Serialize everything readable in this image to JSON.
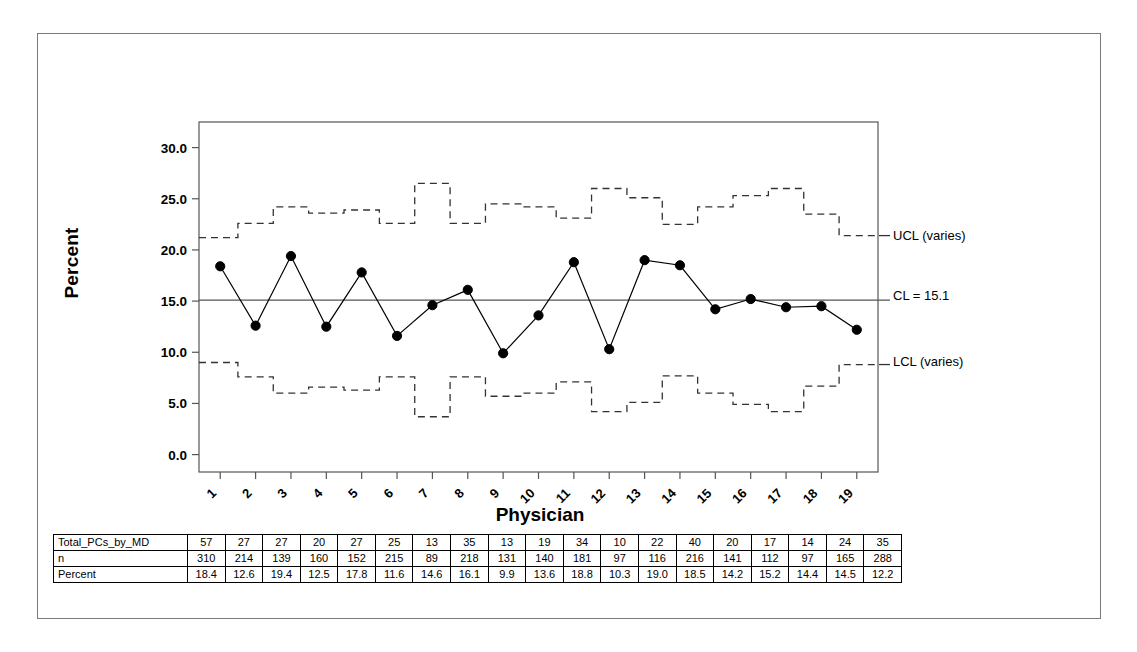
{
  "chart_data": {
    "type": "line",
    "title": "",
    "xlabel": "Physician",
    "ylabel": "Percent",
    "x": [
      1,
      2,
      3,
      4,
      5,
      6,
      7,
      8,
      9,
      10,
      11,
      12,
      13,
      14,
      15,
      16,
      17,
      18,
      19
    ],
    "xticklabels": [
      "1",
      "2",
      "3",
      "4",
      "5",
      "6",
      "7",
      "8",
      "9",
      "10",
      "11",
      "12",
      "13",
      "14",
      "15",
      "16",
      "17",
      "18",
      "19"
    ],
    "yticklabels": [
      "0.0",
      "5.0",
      "10.0",
      "15.0",
      "20.0",
      "25.0",
      "30.0"
    ],
    "ytickvalues": [
      0.0,
      5.0,
      10.0,
      15.0,
      20.0,
      25.0,
      30.0
    ],
    "ylim": [
      -1.7,
      32.5
    ],
    "xlim": [
      0.4,
      19.6
    ],
    "grid": false,
    "legend_position": "right-annotations",
    "series": [
      {
        "name": "Percent",
        "marker": "filled-circle",
        "values": [
          18.4,
          12.6,
          19.4,
          12.5,
          17.8,
          11.6,
          14.6,
          16.1,
          9.9,
          13.6,
          18.8,
          10.3,
          19.0,
          18.5,
          14.2,
          15.2,
          14.4,
          14.5,
          12.2
        ]
      },
      {
        "name": "UCL (varies)",
        "style": "dashed-step",
        "values": [
          21.2,
          22.6,
          24.2,
          23.6,
          23.9,
          22.6,
          26.5,
          22.6,
          24.5,
          24.2,
          23.1,
          26.0,
          25.1,
          22.5,
          24.2,
          25.3,
          26.0,
          23.5,
          21.4
        ]
      },
      {
        "name": "LCL (varies)",
        "style": "dashed-step",
        "values": [
          9.0,
          7.6,
          6.0,
          6.6,
          6.3,
          7.6,
          3.7,
          7.6,
          5.7,
          6.0,
          7.1,
          4.2,
          5.1,
          7.7,
          6.0,
          4.9,
          4.2,
          6.7,
          8.8
        ]
      },
      {
        "name": "CL = 15.1",
        "style": "solid",
        "value": 15.1
      }
    ],
    "annotations": [
      {
        "id": "ucl",
        "text": "UCL (varies)"
      },
      {
        "id": "cl",
        "text": "CL = 15.1"
      },
      {
        "id": "lcl",
        "text": "LCL (varies)"
      }
    ],
    "center_line": 15.1
  },
  "axes": {
    "y_title": "Percent",
    "x_title": "Physician"
  },
  "table": {
    "rows": [
      {
        "label": "Total_PCs_by_MD",
        "values": [
          "57",
          "27",
          "27",
          "20",
          "27",
          "25",
          "13",
          "35",
          "13",
          "19",
          "34",
          "10",
          "22",
          "40",
          "20",
          "17",
          "14",
          "24",
          "35"
        ]
      },
      {
        "label": "n",
        "values": [
          "310",
          "214",
          "139",
          "160",
          "152",
          "215",
          "89",
          "218",
          "131",
          "140",
          "181",
          "97",
          "116",
          "216",
          "141",
          "112",
          "97",
          "165",
          "288"
        ]
      },
      {
        "label": "Percent",
        "values": [
          "18.4",
          "12.6",
          "19.4",
          "12.5",
          "17.8",
          "11.6",
          "14.6",
          "16.1",
          "9.9",
          "13.6",
          "18.8",
          "10.3",
          "19.0",
          "18.5",
          "14.2",
          "15.2",
          "14.4",
          "14.5",
          "12.2"
        ]
      }
    ]
  },
  "colors": {
    "line": "#000000",
    "marker": "#000000",
    "center_line": "#555555",
    "limit_line": "#333333",
    "frame": "#7a7a7a",
    "axis": "#555555"
  }
}
